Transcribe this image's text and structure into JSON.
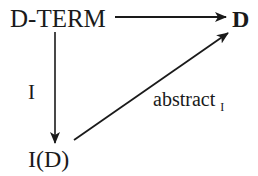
{
  "diagram": {
    "type": "commutative-diagram",
    "nodes": {
      "dterm": {
        "label": "D-TERM"
      },
      "d": {
        "label": "D"
      },
      "id": {
        "label": "I(D)"
      }
    },
    "edges": {
      "top": {
        "from": "D-TERM",
        "to": "D",
        "label": ""
      },
      "left": {
        "from": "D-TERM",
        "to": "I(D)",
        "label": "I"
      },
      "diagonal": {
        "from": "I(D)",
        "to": "D",
        "label": "abstract",
        "label_subscript": "I"
      }
    },
    "colors": {
      "ink": "#1a1a1a",
      "background": "#ffffff"
    }
  }
}
